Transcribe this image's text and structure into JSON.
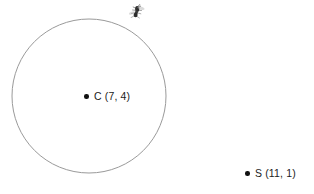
{
  "diagram": {
    "type": "geometry-circle-and-point",
    "background_color": "#ffffff",
    "circle": {
      "name": "circle-outline",
      "stroke_color": "#9a9a9a",
      "stroke_width": 1,
      "fill": "none",
      "center_px": {
        "x": 89,
        "y": 96
      },
      "radius_px": 77
    },
    "points": [
      {
        "id": "center",
        "label": "C (7, 4)",
        "letter": "C",
        "coordinates": "(7, 4)",
        "x": 7,
        "y": 4,
        "dot_color": "#111111",
        "px": {
          "x": 86,
          "y": 96
        }
      },
      {
        "id": "external",
        "label": "S (11, 1)",
        "letter": "S",
        "coordinates": "(11, 1)",
        "x": 11,
        "y": 1,
        "dot_color": "#111111",
        "px": {
          "x": 247,
          "y": 173
        }
      }
    ],
    "sprite": {
      "name": "ant-sprite",
      "description": "small dark insect figure on circle edge",
      "color": "#4a4a4a",
      "px": {
        "x": 137,
        "y": 11
      }
    }
  }
}
